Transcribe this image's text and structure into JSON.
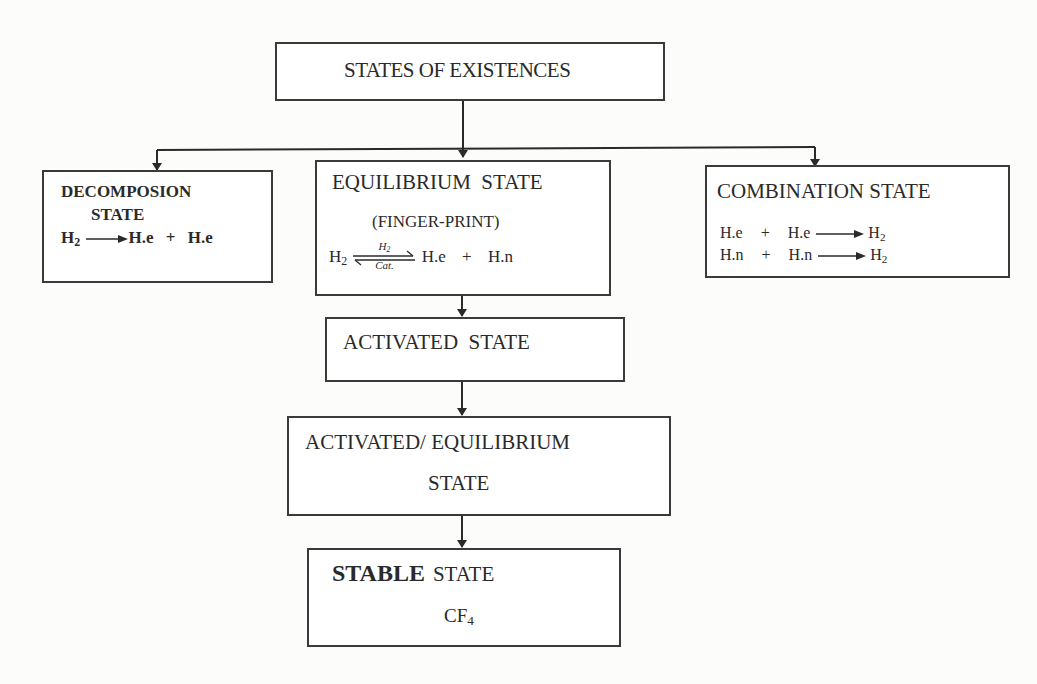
{
  "diagram": {
    "root": {
      "label": "STATES OF EXISTENCES"
    },
    "decomposition": {
      "title_line1": "DECOMPOSION",
      "title_line2": "STATE",
      "eq": {
        "reactant": "H",
        "reactant_sub": "2",
        "product1": "H.e",
        "plus": "+",
        "product2": "H.e"
      }
    },
    "equilibrium": {
      "title": "EQUILIBRIUM  STATE",
      "subtitle": "(FINGER-PRINT)",
      "eq": {
        "reactant": "H",
        "reactant_sub": "2",
        "arrow_top": "H",
        "arrow_top_sub": "2",
        "arrow_bottom": "Cat.",
        "product1": "H.e",
        "plus": "+",
        "product2": "H.n"
      }
    },
    "combination": {
      "title": "COMBINATION STATE",
      "eqs": [
        {
          "a": "H.e",
          "plus": "+",
          "b": "H.e",
          "product": "H",
          "product_sub": "2"
        },
        {
          "a": "H.n",
          "plus": "+",
          "b": "H.n",
          "product": "H",
          "product_sub": "2"
        }
      ]
    },
    "activated": {
      "label": "ACTIVATED  STATE"
    },
    "activated_equilibrium": {
      "line1": "ACTIVATED/ EQUILIBRIUM",
      "line2": "STATE"
    },
    "stable": {
      "bold": "STABLE",
      "rest": "STATE",
      "formula": "CF",
      "formula_sub": "4"
    },
    "edges": [
      {
        "from": "root",
        "to": "decomposition"
      },
      {
        "from": "root",
        "to": "equilibrium"
      },
      {
        "from": "root",
        "to": "combination"
      },
      {
        "from": "equilibrium",
        "to": "activated"
      },
      {
        "from": "activated",
        "to": "activated_equilibrium"
      },
      {
        "from": "activated_equilibrium",
        "to": "stable"
      }
    ]
  }
}
